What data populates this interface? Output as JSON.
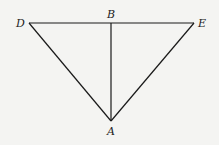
{
  "diagram": {
    "type": "geometry-figure",
    "points": {
      "D": {
        "label": "D",
        "x": 29,
        "y": 23
      },
      "B": {
        "label": "B",
        "x": 111,
        "y": 23
      },
      "E": {
        "label": "E",
        "x": 194,
        "y": 23
      },
      "A": {
        "label": "A",
        "x": 111,
        "y": 121
      }
    },
    "segments": [
      {
        "from": "D",
        "to": "E"
      },
      {
        "from": "D",
        "to": "A"
      },
      {
        "from": "E",
        "to": "A"
      },
      {
        "from": "B",
        "to": "A"
      }
    ],
    "labels": {
      "D": "D",
      "B": "B",
      "E": "E",
      "A": "A"
    }
  }
}
